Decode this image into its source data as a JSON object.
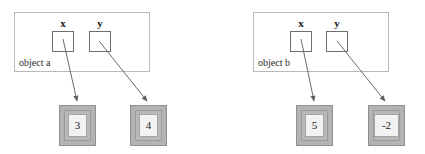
{
  "diagram": {
    "type": "object-reference-diagram",
    "colors": {
      "frame_border": "#b9b9b9",
      "var_box_border": "#6e6e6e",
      "value_box_fill": "#b3b3b3",
      "value_chip_fill": "#f2f2f2",
      "arrow": "#6b6b6b",
      "text": "#1a1a1a",
      "background": "#ffffff"
    },
    "objects": [
      {
        "id": "object-a",
        "label": "object a",
        "variables": [
          {
            "name": "x",
            "label": "x",
            "points_to": "value-3"
          },
          {
            "name": "y",
            "label": "y",
            "points_to": "value-4"
          }
        ],
        "values": [
          {
            "id": "value-3",
            "text": "3"
          },
          {
            "id": "value-4",
            "text": "4"
          }
        ]
      },
      {
        "id": "object-b",
        "label": "object b",
        "variables": [
          {
            "name": "x",
            "label": "x",
            "points_to": "value-5"
          },
          {
            "name": "y",
            "label": "y",
            "points_to": "value-neg2"
          }
        ],
        "values": [
          {
            "id": "value-5",
            "text": "5"
          },
          {
            "id": "value-neg2",
            "text": "-2"
          }
        ]
      }
    ]
  }
}
